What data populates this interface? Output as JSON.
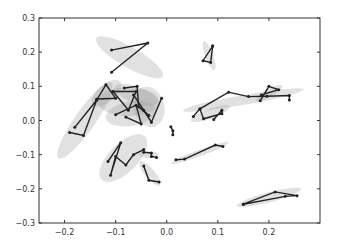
{
  "chart_data": {
    "type": "line",
    "title": "",
    "xlabel": "",
    "ylabel": "",
    "xlim": [
      -0.25,
      0.3
    ],
    "ylim": [
      -0.3,
      0.3
    ],
    "grid": false,
    "legend": null,
    "xticks": [
      "-0.2",
      "-0.1",
      "0.0",
      "0.1",
      "0.2"
    ],
    "xtick_values": [
      -0.2,
      -0.1,
      0.0,
      0.1,
      0.2
    ],
    "yticks": [
      "0.3",
      "0.2",
      "0.1",
      "0.0",
      "-0.1",
      "-0.2",
      "-0.3"
    ],
    "ytick_values": [
      0.3,
      0.2,
      0.1,
      0.0,
      -0.1,
      -0.2,
      -0.3
    ],
    "line_color": "#222222",
    "ellipse_color": "#9a9a9a",
    "series": [
      {
        "name": "g1",
        "points": [
          [
            -0.108,
            0.206
          ],
          [
            -0.037,
            0.227
          ],
          [
            -0.108,
            0.141
          ]
        ],
        "ellipse": {
          "cx": -0.073,
          "cy": 0.185,
          "rx": 0.075,
          "ry": 0.025,
          "angle": -30
        }
      },
      {
        "name": "g2",
        "points": [
          [
            0.09,
            0.218
          ],
          [
            0.071,
            0.175
          ],
          [
            0.086,
            0.17
          ],
          [
            0.09,
            0.218
          ]
        ],
        "ellipse": {
          "cx": 0.083,
          "cy": 0.19,
          "rx": 0.03,
          "ry": 0.01,
          "angle": -70
        }
      },
      {
        "name": "g3",
        "points": [
          [
            -0.18,
            -0.02
          ],
          [
            -0.137,
            0.06
          ],
          [
            -0.163,
            -0.044
          ],
          [
            -0.19,
            -0.035
          ]
        ],
        "ellipse": {
          "cx": -0.16,
          "cy": 0.0,
          "rx": 0.09,
          "ry": 0.025,
          "angle": 55
        }
      },
      {
        "name": "g4",
        "points": [
          [
            -0.137,
            0.06
          ],
          [
            -0.119,
            0.105
          ],
          [
            -0.1,
            0.065
          ],
          [
            -0.137,
            0.063
          ]
        ],
        "ellipse": {
          "cx": -0.118,
          "cy": 0.08,
          "rx": 0.035,
          "ry": 0.022,
          "angle": 40
        }
      },
      {
        "name": "g5",
        "points": [
          [
            -0.105,
            0.085
          ],
          [
            -0.06,
            0.085
          ],
          [
            -0.075,
            0.03
          ],
          [
            -0.105,
            0.085
          ]
        ],
        "ellipse": {
          "cx": -0.075,
          "cy": 0.055,
          "rx": 0.06,
          "ry": 0.035,
          "angle": 0
        }
      },
      {
        "name": "g6",
        "points": [
          [
            -0.083,
            0.095
          ],
          [
            -0.058,
            0.1
          ],
          [
            -0.055,
            0.04
          ],
          [
            -0.035,
            0.015
          ]
        ],
        "ellipse": {
          "cx": -0.06,
          "cy": 0.075,
          "rx": 0.045,
          "ry": 0.02,
          "angle": -20
        }
      },
      {
        "name": "g7",
        "points": [
          [
            -0.1,
            0.017
          ],
          [
            -0.06,
            0.045
          ],
          [
            -0.05,
            -0.01
          ],
          [
            -0.08,
            0.01
          ]
        ],
        "ellipse": {
          "cx": -0.07,
          "cy": 0.02,
          "rx": 0.05,
          "ry": 0.03,
          "angle": 10
        }
      },
      {
        "name": "g8",
        "points": [
          [
            -0.065,
            0.075
          ],
          [
            -0.045,
            0.03
          ],
          [
            -0.03,
            -0.005
          ],
          [
            -0.01,
            0.065
          ]
        ],
        "ellipse": {
          "cx": -0.035,
          "cy": 0.04,
          "rx": 0.03,
          "ry": 0.05,
          "angle": 15
        }
      },
      {
        "name": "g9",
        "points": [
          [
            0.008,
            -0.018
          ],
          [
            0.012,
            -0.03
          ],
          [
            0.012,
            -0.042
          ]
        ],
        "ellipse": null
      },
      {
        "name": "g10",
        "points": [
          [
            0.052,
            0.012
          ],
          [
            0.065,
            0.034
          ],
          [
            0.121,
            0.083
          ],
          [
            0.16,
            0.07
          ],
          [
            0.196,
            0.071
          ],
          [
            0.24,
            0.073
          ],
          [
            0.24,
            0.06
          ]
        ],
        "ellipse": {
          "cx": 0.15,
          "cy": 0.06,
          "rx": 0.12,
          "ry": 0.012,
          "angle": 10
        }
      },
      {
        "name": "g11",
        "points": [
          [
            0.183,
            0.058
          ],
          [
            0.2,
            0.1
          ],
          [
            0.219,
            0.09
          ],
          [
            0.185,
            0.075
          ]
        ],
        "ellipse": {
          "cx": 0.2,
          "cy": 0.08,
          "rx": 0.03,
          "ry": 0.01,
          "angle": 30
        }
      },
      {
        "name": "g12",
        "points": [
          [
            0.065,
            0.034
          ],
          [
            0.072,
            0.005
          ],
          [
            0.108,
            0.02
          ],
          [
            0.108,
            0.03
          ],
          [
            0.092,
            0.003
          ]
        ],
        "ellipse": {
          "cx": 0.085,
          "cy": 0.02,
          "rx": 0.04,
          "ry": 0.012,
          "angle": 20
        }
      },
      {
        "name": "g13",
        "points": [
          [
            -0.115,
            -0.12
          ],
          [
            -0.09,
            -0.065
          ],
          [
            -0.11,
            -0.16
          ],
          [
            -0.1,
            -0.105
          ],
          [
            -0.08,
            -0.13
          ],
          [
            -0.065,
            -0.1
          ],
          [
            -0.045,
            -0.085
          ]
        ],
        "ellipse": {
          "cx": -0.085,
          "cy": -0.11,
          "rx": 0.06,
          "ry": 0.035,
          "angle": 45
        }
      },
      {
        "name": "g14",
        "points": [
          [
            -0.045,
            -0.093
          ],
          [
            -0.03,
            -0.095
          ],
          [
            -0.03,
            -0.105
          ],
          [
            -0.02,
            -0.108
          ]
        ],
        "ellipse": {
          "cx": -0.035,
          "cy": -0.1,
          "rx": 0.02,
          "ry": 0.008,
          "angle": 0
        }
      },
      {
        "name": "g15",
        "points": [
          [
            -0.045,
            -0.133
          ],
          [
            -0.035,
            -0.175
          ],
          [
            -0.015,
            -0.18
          ]
        ],
        "ellipse": {
          "cx": -0.033,
          "cy": -0.155,
          "rx": 0.03,
          "ry": 0.012,
          "angle": -50
        }
      },
      {
        "name": "g16",
        "points": [
          [
            0.018,
            -0.115
          ],
          [
            0.035,
            -0.113
          ],
          [
            0.095,
            -0.072
          ],
          [
            0.11,
            -0.076
          ]
        ],
        "ellipse": {
          "cx": 0.065,
          "cy": -0.095,
          "rx": 0.06,
          "ry": 0.008,
          "angle": 20
        }
      },
      {
        "name": "g17",
        "points": [
          [
            0.15,
            -0.245
          ],
          [
            0.212,
            -0.209
          ],
          [
            0.255,
            -0.22
          ],
          [
            0.232,
            -0.222
          ],
          [
            0.15,
            -0.245
          ]
        ],
        "ellipse": {
          "cx": 0.2,
          "cy": -0.225,
          "rx": 0.065,
          "ry": 0.012,
          "angle": 15
        }
      }
    ]
  }
}
